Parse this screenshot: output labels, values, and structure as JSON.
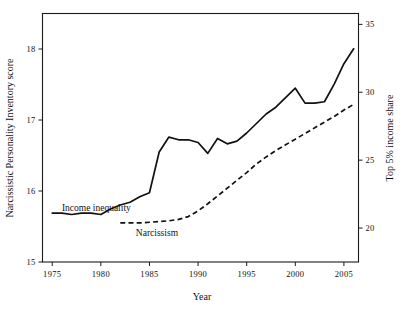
{
  "chart_data": {
    "type": "line",
    "title": "",
    "xlabel": "Year",
    "ylabel": "Narcissistic Personality Inventory score",
    "y2label": "Top 5% income share",
    "xlim": [
      1974,
      2006.5
    ],
    "ylim": [
      15,
      18.5
    ],
    "y2lim": [
      17.5,
      35.8
    ],
    "grid": false,
    "legend_position": "inline-annotations",
    "xticks": [
      1975,
      1980,
      1985,
      1990,
      1995,
      2000,
      2005
    ],
    "xtick_labels": [
      "1975",
      "1980",
      "1985",
      "1990",
      "1995",
      "2000",
      "2005"
    ],
    "yticks": [
      15,
      16,
      17,
      18
    ],
    "ytick_labels": [
      "15",
      "16",
      "17",
      "18"
    ],
    "y2ticks": [
      20,
      25,
      30,
      35
    ],
    "y2tick_labels": [
      "20",
      "25",
      "30",
      "35"
    ],
    "annotations": [
      {
        "text": "Income inequality",
        "x": 1976.0,
        "y": 15.72,
        "series": "income_inequality"
      },
      {
        "text": "Narcissism",
        "x": 1983.6,
        "y": 15.37,
        "series": "narcissism"
      }
    ],
    "series": [
      {
        "name": "Income inequality",
        "axis": "right",
        "style": "solid",
        "label": "Income inequality",
        "x": [
          1975,
          1976,
          1977,
          1978,
          1979,
          1980,
          1981,
          1982,
          1983,
          1984,
          1985,
          1986,
          1987,
          1988,
          1989,
          1990,
          1991,
          1992,
          1993,
          1994,
          1995,
          1996,
          1997,
          1998,
          1999,
          2000,
          2001,
          2002,
          2003,
          2004,
          2005,
          2006
        ],
        "values": [
          21.1,
          21.1,
          21.0,
          21.1,
          21.1,
          21.0,
          21.4,
          21.7,
          21.9,
          22.3,
          22.6,
          25.6,
          26.7,
          26.5,
          26.5,
          26.3,
          25.5,
          26.6,
          26.2,
          26.4,
          27.0,
          27.7,
          28.4,
          28.9,
          29.6,
          30.3,
          29.2,
          29.2,
          29.3,
          30.6,
          32.1,
          33.2
        ]
      },
      {
        "name": "Narcissism",
        "axis": "left",
        "style": "dashed",
        "label": "Narcissism",
        "x": [
          1982,
          1983,
          1984,
          1985,
          1986,
          1987,
          1988,
          1989,
          1990,
          1991,
          1992,
          1993,
          1994,
          1995,
          1996,
          1997,
          1998,
          1999,
          2000,
          2001,
          2002,
          2003,
          2004,
          2005,
          2006
        ],
        "values": [
          15.55,
          15.55,
          15.55,
          15.56,
          15.57,
          15.58,
          15.6,
          15.64,
          15.72,
          15.82,
          15.93,
          16.04,
          16.15,
          16.26,
          16.38,
          16.48,
          16.57,
          16.65,
          16.73,
          16.81,
          16.89,
          16.97,
          17.05,
          17.14,
          17.22
        ]
      }
    ]
  }
}
